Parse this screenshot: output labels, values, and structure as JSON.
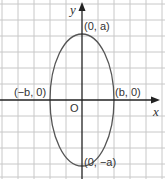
{
  "diagram": {
    "type": "ellipse-graph",
    "axes": {
      "x_label": "x",
      "y_label": "y",
      "origin_label": "O"
    },
    "points": {
      "top": "(0, a)",
      "bottom": "(0, −a)",
      "left": "(−b, 0)",
      "right": "(b, 0)"
    },
    "colors": {
      "grid": "#c8c8c8",
      "curve": "#555555",
      "axis": "#222222"
    }
  }
}
